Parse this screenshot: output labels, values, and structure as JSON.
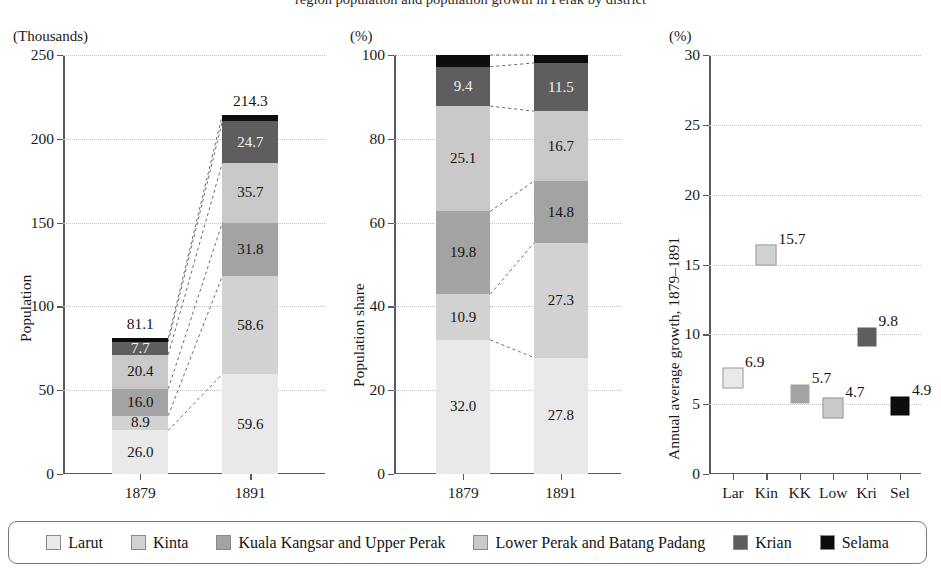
{
  "clipped_title": "region population and population growth in Perak by district",
  "series": [
    {
      "key": "larut",
      "label": "Larut",
      "color": "#e9e9e9"
    },
    {
      "key": "kinta",
      "label": "Kinta",
      "color": "#d2d2d2"
    },
    {
      "key": "kuala_kangsar",
      "label": "Kuala Kangsar and Upper Perak",
      "color": "#a3a3a3"
    },
    {
      "key": "lower_perak",
      "label": "Lower Perak and Batang Padang",
      "color": "#c9c9c9"
    },
    {
      "key": "krian",
      "label": "Krian",
      "color": "#5e5e5e"
    },
    {
      "key": "selama",
      "label": "Selama",
      "color": "#0d0d0d"
    }
  ],
  "chart_data": [
    {
      "type": "bar",
      "id": "population",
      "stacked": true,
      "title": "",
      "unit_label": "(Thousands)",
      "ylabel": "Population",
      "xlabel": "",
      "categories": [
        "1879",
        "1891"
      ],
      "ylim": [
        0,
        250
      ],
      "yticks": [
        0,
        50,
        100,
        150,
        200,
        250
      ],
      "grid": true,
      "series": [
        {
          "name": "Larut",
          "values": [
            26.0,
            59.6
          ],
          "labels": [
            "26.0",
            "59.6"
          ]
        },
        {
          "name": "Kinta",
          "values": [
            8.9,
            58.6
          ],
          "labels": [
            "8.9",
            "58.6"
          ]
        },
        {
          "name": "Kuala Kangsar and Upper Perak",
          "values": [
            16.0,
            31.8
          ],
          "labels": [
            "16.0",
            "31.8"
          ]
        },
        {
          "name": "Lower Perak and Batang Padang",
          "values": [
            20.4,
            35.7
          ],
          "labels": [
            "20.4",
            "35.7"
          ]
        },
        {
          "name": "Krian",
          "values": [
            7.7,
            24.7
          ],
          "labels": [
            "7.7",
            "24.7"
          ]
        },
        {
          "name": "Selama",
          "values": [
            2.1,
            3.9
          ],
          "labels": [
            "",
            ""
          ]
        }
      ],
      "totals": [
        "81.1",
        "214.3"
      ]
    },
    {
      "type": "bar",
      "id": "population-share",
      "stacked": true,
      "title": "",
      "unit_label": "(%)",
      "ylabel": "Population share",
      "xlabel": "",
      "categories": [
        "1879",
        "1891"
      ],
      "ylim": [
        0,
        100
      ],
      "yticks": [
        0,
        20,
        40,
        60,
        80,
        100
      ],
      "grid": true,
      "series": [
        {
          "name": "Larut",
          "values": [
            32.0,
            27.8
          ],
          "labels": [
            "32.0",
            "27.8"
          ]
        },
        {
          "name": "Kinta",
          "values": [
            10.9,
            27.3
          ],
          "labels": [
            "10.9",
            "27.3"
          ]
        },
        {
          "name": "Kuala Kangsar and Upper Perak",
          "values": [
            19.8,
            14.8
          ],
          "labels": [
            "19.8",
            "14.8"
          ]
        },
        {
          "name": "Lower Perak and Batang Padang",
          "values": [
            25.1,
            16.7
          ],
          "labels": [
            "25.1",
            "16.7"
          ]
        },
        {
          "name": "Krian",
          "values": [
            9.4,
            11.5
          ],
          "labels": [
            "9.4",
            "11.5"
          ]
        },
        {
          "name": "Selama",
          "values": [
            2.8,
            1.9
          ],
          "labels": [
            "",
            ""
          ]
        }
      ],
      "totals": [
        "",
        ""
      ]
    },
    {
      "type": "scatter",
      "id": "annual-growth",
      "title": "",
      "unit_label": "(%)",
      "ylabel": "Annual average growth, 1879–1891",
      "xlabel": "",
      "categories": [
        "Lar",
        "Kin",
        "KK",
        "Low",
        "Kri",
        "Sel"
      ],
      "values": [
        6.9,
        15.7,
        5.7,
        4.7,
        9.8,
        4.9
      ],
      "labels": [
        "6.9",
        "15.7",
        "5.7",
        "4.7",
        "9.8",
        "4.9"
      ],
      "point_colors": [
        "#e9e9e9",
        "#d2d2d2",
        "#a3a3a3",
        "#c9c9c9",
        "#5e5e5e",
        "#0d0d0d"
      ],
      "ylim": [
        0,
        30
      ],
      "yticks": [
        0,
        5,
        10,
        15,
        20,
        25,
        30
      ],
      "grid": true
    }
  ],
  "legend": {
    "position": "bottom",
    "items": [
      {
        "label": "Larut",
        "color": "#e9e9e9"
      },
      {
        "label": "Kinta",
        "color": "#d2d2d2"
      },
      {
        "label": "Kuala Kangsar and Upper Perak",
        "color": "#a3a3a3"
      },
      {
        "label": "Lower Perak and Batang Padang",
        "color": "#c9c9c9"
      },
      {
        "label": "Krian",
        "color": "#5e5e5e"
      },
      {
        "label": "Selama",
        "color": "#0d0d0d"
      }
    ]
  }
}
